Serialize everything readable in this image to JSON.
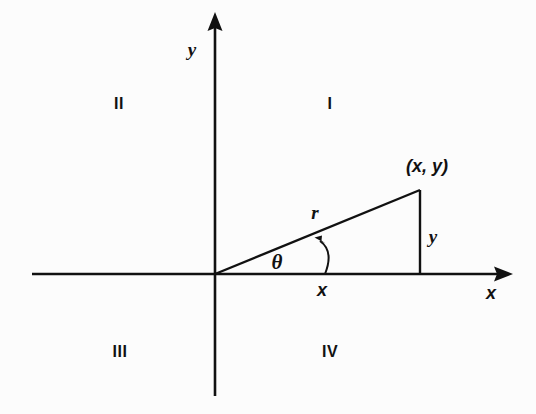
{
  "figure": {
    "background_color": "#fcfcfc",
    "stroke_color": "#111111"
  },
  "axes": {
    "x_axis_label": "x",
    "y_axis_label": "y",
    "origin": {
      "x": 215,
      "y": 274
    },
    "x_axis": {
      "x1": 32,
      "y1": 274,
      "x2": 513,
      "y2": 274
    },
    "y_axis": {
      "x1": 215,
      "y1": 12,
      "x2": 215,
      "y2": 396
    }
  },
  "quadrants": [
    {
      "label": "I",
      "x": 330,
      "y": 104
    },
    {
      "label": "II",
      "x": 119,
      "y": 104
    },
    {
      "label": "III",
      "x": 120,
      "y": 352
    },
    {
      "label": "IV",
      "x": 330,
      "y": 352
    }
  ],
  "triangle": {
    "point_label": "(x, y)",
    "point": {
      "x": 420,
      "y": 190
    },
    "radius_label": "r",
    "angle_label": "θ",
    "adjacent_label": "x",
    "opposite_label": "y",
    "hypotenuse": {
      "x1": 215,
      "y1": 274,
      "x2": 420,
      "y2": 190
    },
    "vertical_leg": {
      "x1": 420,
      "y1": 190,
      "x2": 420,
      "y2": 274
    }
  },
  "labels": {
    "y_axis": {
      "text": "y",
      "x": 192,
      "y": 49
    },
    "x_axis": {
      "text": "x",
      "x": 491,
      "y": 293
    },
    "point": {
      "text": "(x, y)",
      "x": 427,
      "y": 166
    },
    "radius": {
      "text": "r",
      "x": 315,
      "y": 212
    },
    "angle": {
      "text": "θ",
      "x": 277,
      "y": 262
    },
    "adjacent": {
      "text": "x",
      "x": 322,
      "y": 290
    },
    "opposite": {
      "text": "y",
      "x": 433,
      "y": 236
    }
  }
}
